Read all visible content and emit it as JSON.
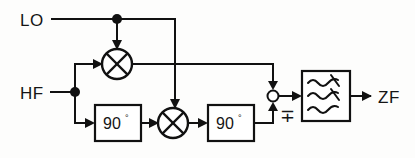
{
  "diagram": {
    "type": "block-diagram",
    "canvas": {
      "width": 415,
      "height": 158,
      "background": "#fdfdfc"
    },
    "line_color": "#111111",
    "text_color": "#151515",
    "ports": [
      {
        "id": "lo-input",
        "label": "LO",
        "x": 22,
        "y": 25,
        "role": "input",
        "description": "local oscillator input"
      },
      {
        "id": "hf-input",
        "label": "HF",
        "x": 22,
        "y": 99,
        "role": "input",
        "description": "high frequency / RF input"
      },
      {
        "id": "zf-output",
        "label": "ZF",
        "x": 379,
        "y": 103,
        "role": "output",
        "description": "intermediate frequency output"
      }
    ],
    "blocks": [
      {
        "id": "phase-shift-input",
        "label": "90",
        "superscript": "°",
        "x": 95,
        "y": 105,
        "width": 46,
        "height": 36,
        "kind": "phase-shifter"
      },
      {
        "id": "phase-shift-output",
        "label": "90",
        "superscript": "°",
        "x": 208,
        "y": 105,
        "width": 46,
        "height": 36,
        "kind": "phase-shifter"
      },
      {
        "id": "lowpass-filter",
        "label": "",
        "x": 302,
        "y": 71,
        "width": 48,
        "height": 50,
        "kind": "filter",
        "symbol": "wavy-lowpass-lines"
      }
    ],
    "mixers": [
      {
        "id": "mixer-i",
        "cx": 117,
        "cy": 64,
        "r": 15,
        "kind": "multiplier"
      },
      {
        "id": "mixer-q",
        "cx": 173,
        "cy": 123,
        "r": 15,
        "kind": "multiplier"
      }
    ],
    "summing_node": {
      "id": "summing-node",
      "cx": 273,
      "cy": 96,
      "r": 5.5,
      "sign_label": "∓",
      "sign_x": 281,
      "sign_y": 120,
      "description": "combiner with minus-or-plus sign selecting sideband"
    },
    "junctions": [
      {
        "id": "lo-junction",
        "cx": 117,
        "cy": 19,
        "r": 5
      },
      {
        "id": "hf-junction",
        "cx": 75,
        "cy": 92,
        "r": 5
      }
    ],
    "wires": [
      {
        "id": "wire-lo-to-junction",
        "path": "M 52 19 H 117"
      },
      {
        "id": "wire-lo-to-mixer-i",
        "path": "M 117 19 V 43"
      },
      {
        "id": "wire-lo-branch-to-mixer-q",
        "path": "M 117 19 H 175 V 102"
      },
      {
        "id": "wire-hf-to-junction",
        "path": "M 51 92 H 75"
      },
      {
        "id": "wire-hf-up-to-mixer-i",
        "path": "M 75 92 V 64 H 96"
      },
      {
        "id": "wire-hf-down-to-phase-shift",
        "path": "M 75 92 V 123 H 88"
      },
      {
        "id": "wire-mixer-i-to-sum",
        "path": "M 132 64 H 273 V 84"
      },
      {
        "id": "wire-phase-shift-input-to-mixer-q",
        "path": "M 141 123 H 152"
      },
      {
        "id": "wire-mixer-q-to-phase-shift-output",
        "path": "M 188 123 H 201"
      },
      {
        "id": "wire-phase-shift-output-to-sum",
        "path": "M 254 123 H 258 V 96 V 108"
      },
      {
        "id": "wire-sum-to-filter",
        "path": "M 279 96 H 295"
      },
      {
        "id": "wire-filter-to-zf",
        "path": "M 350 96 H 369"
      }
    ],
    "arrows": [
      {
        "id": "arrow-into-mixer-i-top",
        "x": 117,
        "y": 48,
        "dir": "down"
      },
      {
        "id": "arrow-into-mixer-i-left",
        "x": 101,
        "y": 64,
        "dir": "right"
      },
      {
        "id": "arrow-into-mixer-q-top",
        "x": 175,
        "y": 107,
        "dir": "down"
      },
      {
        "id": "arrow-into-phase-shift-input",
        "x": 93,
        "y": 123,
        "dir": "right"
      },
      {
        "id": "arrow-into-mixer-q-left",
        "x": 157,
        "y": 123,
        "dir": "right"
      },
      {
        "id": "arrow-into-phase-shift-output",
        "x": 206,
        "y": 123,
        "dir": "right"
      },
      {
        "id": "arrow-into-sum-top",
        "x": 273,
        "y": 89,
        "dir": "down"
      },
      {
        "id": "arrow-into-sum-bottom",
        "x": 273,
        "y": 104,
        "dir": "up"
      },
      {
        "id": "arrow-into-filter",
        "x": 300,
        "y": 96,
        "dir": "right"
      },
      {
        "id": "arrow-to-zf",
        "x": 372,
        "y": 96,
        "dir": "right"
      }
    ],
    "filter_waves": [
      {
        "id": "filter-wave-1",
        "path": "M 310 82 q 6 -7 12 0 t 12 0 t 10 -2"
      },
      {
        "id": "filter-wave-2",
        "path": "M 310 95 q 6 -7 12 0 t 12 0 t 10 -2"
      },
      {
        "id": "filter-wave-3",
        "path": "M 310 110 q 6 -7 12 0 t 12 0 t 10 -2"
      }
    ],
    "filter_cross_marks": [
      {
        "id": "filter-cross-upper",
        "x1": 330,
        "y1": 72,
        "x2": 339,
        "y2": 85
      },
      {
        "id": "filter-cross-lower",
        "x1": 330,
        "y1": 86,
        "x2": 339,
        "y2": 99
      }
    ]
  }
}
